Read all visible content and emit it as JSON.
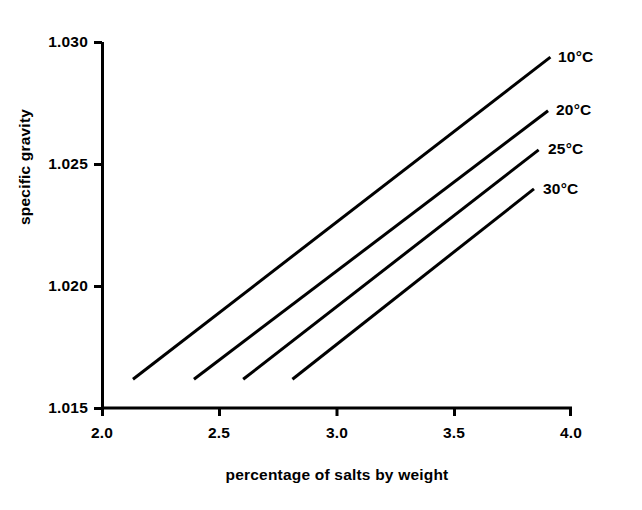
{
  "chart_data": {
    "type": "line",
    "title": "",
    "subtitle": "",
    "xlabel": "percentage of salts by weight",
    "ylabel": "specific gravity",
    "xlim": [
      2.0,
      4.0
    ],
    "ylim": [
      1.015,
      1.03
    ],
    "xticks": [
      "2.0",
      "2.5",
      "3.0",
      "3.5",
      "4.0"
    ],
    "yticks": [
      "1.015",
      "1.020",
      "1.025",
      "1.030"
    ],
    "grid": false,
    "legend_position": "inline-right-end-labels",
    "line_color": "#000000",
    "background_color": "#ffffff",
    "axis_color": "#000000",
    "series": [
      {
        "name": "10°C",
        "label": "10°C",
        "x": [
          2.13,
          3.91
        ],
        "y": [
          1.0162,
          1.0294
        ]
      },
      {
        "name": "20°C",
        "label": "20°C",
        "x": [
          2.39,
          3.9
        ],
        "y": [
          1.0162,
          1.0272
        ]
      },
      {
        "name": "25°C",
        "label": "25°C",
        "x": [
          2.6,
          3.86
        ],
        "y": [
          1.0162,
          1.0256
        ]
      },
      {
        "name": "30°C",
        "label": "30°C",
        "x": [
          2.81,
          3.84
        ],
        "y": [
          1.0162,
          1.024
        ]
      }
    ]
  },
  "axis": {
    "y_title": "specific gravity",
    "x_title": "percentage of salts by weight",
    "y_tick_0": "1.015",
    "y_tick_1": "1.020",
    "y_tick_2": "1.025",
    "y_tick_3": "1.030",
    "x_tick_0": "2.0",
    "x_tick_1": "2.5",
    "x_tick_2": "3.0",
    "x_tick_3": "3.5",
    "x_tick_4": "4.0"
  },
  "series_labels": {
    "s0": "10°C",
    "s1": "20°C",
    "s2": "25°C",
    "s3": "30°C"
  }
}
